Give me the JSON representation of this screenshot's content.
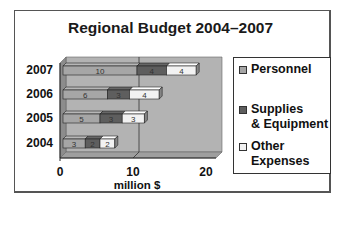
{
  "chart_data": {
    "type": "bar",
    "orientation": "horizontal",
    "stacked": true,
    "three_d": true,
    "title": "Regional Budget 2004–2007",
    "xlabel": "million $",
    "ylabel": "",
    "categories": [
      "2004",
      "2005",
      "2006",
      "2007"
    ],
    "series": [
      {
        "name": "Personnel",
        "values": [
          3,
          5,
          6,
          10
        ],
        "color": "#a6a6a6"
      },
      {
        "name": "Supplies & Equipment",
        "values": [
          2,
          3,
          3,
          4
        ],
        "color": "#5e5e5e"
      },
      {
        "name": "Other Expenses",
        "values": [
          2,
          3,
          4,
          4
        ],
        "color": "#f2f2f2"
      }
    ],
    "xlim": [
      0,
      20
    ],
    "xticks": [
      "0",
      "10",
      "20"
    ],
    "grid": true,
    "legend_position": "right",
    "data_labels": true
  },
  "legend": {
    "items": [
      {
        "line1": "Personnel",
        "line2": ""
      },
      {
        "line1": "Supplies",
        "line2": "& Equipment"
      },
      {
        "line1": "Other",
        "line2": "Expenses"
      }
    ]
  }
}
